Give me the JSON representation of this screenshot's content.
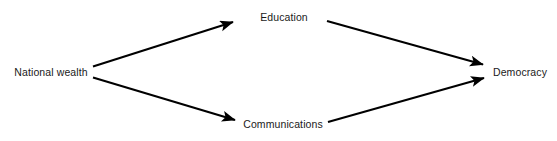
{
  "diagram": {
    "background_color": "#ffffff",
    "line_color": "#000000",
    "text_color": "#1a1a1a",
    "nodes": [
      {
        "id": "national_wealth",
        "label": "National wealth",
        "x": 51,
        "y": 72
      },
      {
        "id": "education",
        "label": "Education",
        "x": 284,
        "y": 17
      },
      {
        "id": "communications",
        "label": "Communications",
        "x": 283,
        "y": 124
      },
      {
        "id": "democracy",
        "label": "Democracy",
        "x": 520,
        "y": 72
      }
    ],
    "edges": [
      {
        "id": "wealth_to_education",
        "from": "national_wealth",
        "to": "education",
        "label": ""
      },
      {
        "id": "wealth_to_communications",
        "from": "national_wealth",
        "to": "communications",
        "label": ""
      },
      {
        "id": "education_to_democracy",
        "from": "education",
        "to": "democracy",
        "label": ""
      },
      {
        "id": "communications_to_democracy",
        "from": "communications",
        "to": "democracy",
        "label": ""
      }
    ]
  }
}
